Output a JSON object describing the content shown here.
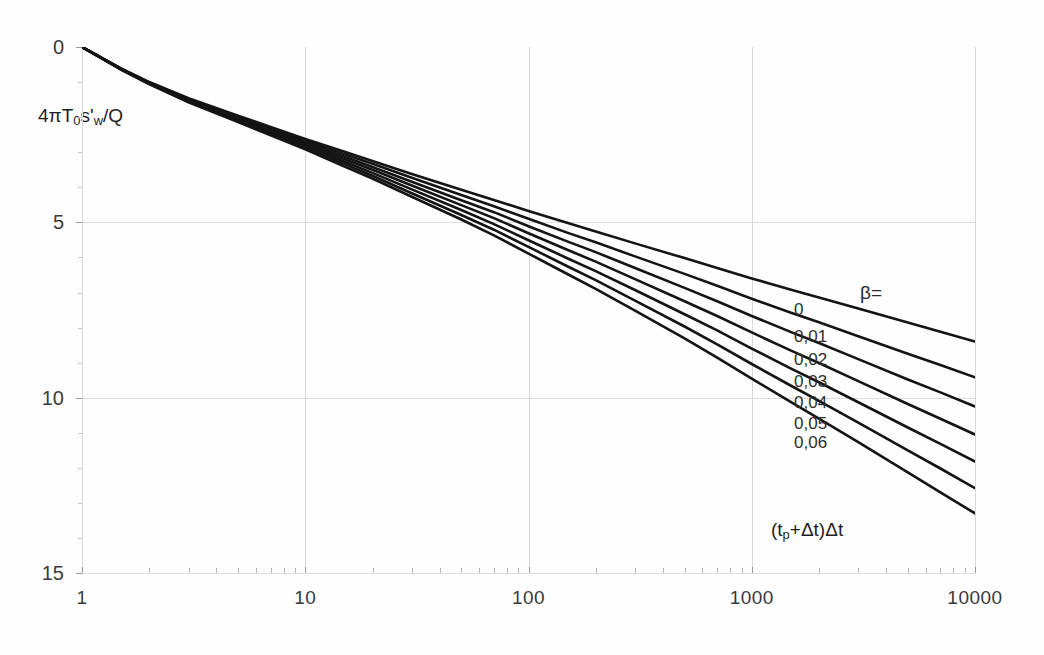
{
  "figure": {
    "kind": "semi-log-plot",
    "background": "#fefefe",
    "ink_color": "#141414",
    "grid_color": "#d8d8d8"
  },
  "chart_data": {
    "type": "line",
    "title": "",
    "xlabel": "(t_p+Δt)Δt",
    "ylabel": "4πT_0s'_w/Q",
    "xscale": "log",
    "yscale": "linear",
    "y_inverted": true,
    "xlim": [
      1,
      10000
    ],
    "ylim": [
      0,
      15
    ],
    "grid": "major-x-and-y",
    "xticks": [
      1,
      10,
      100,
      1000,
      10000
    ],
    "xtick_labels": [
      "1",
      "10",
      "100",
      "1000",
      "10000"
    ],
    "yticks": [
      0,
      5,
      10,
      15
    ],
    "ytick_labels": [
      "0",
      "5",
      "10",
      "15"
    ],
    "legend_position": "inline-right-end-of-curves",
    "legend_title": "β=",
    "annotations": [
      {
        "text": "4πT₀s'ᵥᵥ/Q",
        "kind": "y-axis-title"
      },
      {
        "text": "(tₚ+Δt)Δt",
        "kind": "x-axis-title"
      },
      {
        "text": "β=",
        "kind": "series-group-label"
      }
    ],
    "x": [
      1,
      1.5,
      2,
      3,
      5,
      7,
      10,
      15,
      20,
      30,
      50,
      70,
      100,
      150,
      200,
      300,
      500,
      700,
      1000,
      1500,
      2000,
      3000,
      5000,
      7000,
      10000
    ],
    "series": [
      {
        "name": "0",
        "label": "0",
        "beta": 0.0,
        "values": [
          0.0,
          0.62,
          1.0,
          1.46,
          1.96,
          2.28,
          2.62,
          2.99,
          3.25,
          3.62,
          4.07,
          4.36,
          4.68,
          5.02,
          5.26,
          5.6,
          6.02,
          6.3,
          6.6,
          6.92,
          7.14,
          7.46,
          7.86,
          8.12,
          8.4
        ]
      },
      {
        "name": "0,01",
        "label": "0,01",
        "beta": 0.01,
        "values": [
          0.0,
          0.62,
          1.01,
          1.48,
          1.99,
          2.32,
          2.67,
          3.06,
          3.33,
          3.73,
          4.22,
          4.54,
          4.9,
          5.3,
          5.57,
          5.97,
          6.47,
          6.81,
          7.18,
          7.58,
          7.85,
          8.25,
          8.75,
          9.07,
          9.42
        ]
      },
      {
        "name": "0,02",
        "label": "0,02",
        "beta": 0.02,
        "values": [
          0.0,
          0.63,
          1.02,
          1.5,
          2.02,
          2.36,
          2.72,
          3.13,
          3.42,
          3.84,
          4.37,
          4.71,
          5.11,
          5.55,
          5.85,
          6.3,
          6.87,
          7.25,
          7.67,
          8.13,
          8.44,
          8.9,
          9.48,
          9.85,
          10.25
        ]
      },
      {
        "name": "0,03",
        "label": "0,03",
        "beta": 0.03,
        "values": [
          0.0,
          0.63,
          1.03,
          1.52,
          2.05,
          2.4,
          2.77,
          3.2,
          3.5,
          3.95,
          4.51,
          4.88,
          5.31,
          5.79,
          6.12,
          6.62,
          7.25,
          7.67,
          8.14,
          8.66,
          9.01,
          9.53,
          10.18,
          10.6,
          11.05
        ]
      },
      {
        "name": "0,04",
        "label": "0,04",
        "beta": 0.04,
        "values": [
          0.0,
          0.64,
          1.04,
          1.54,
          2.08,
          2.44,
          2.82,
          3.27,
          3.59,
          4.06,
          4.65,
          5.05,
          5.51,
          6.03,
          6.39,
          6.93,
          7.62,
          8.08,
          8.6,
          9.17,
          9.56,
          10.13,
          10.85,
          11.32,
          11.82
        ]
      },
      {
        "name": "0,05",
        "label": "0,05",
        "beta": 0.05,
        "values": [
          0.0,
          0.64,
          1.05,
          1.56,
          2.11,
          2.48,
          2.87,
          3.34,
          3.67,
          4.17,
          4.79,
          5.21,
          5.7,
          6.26,
          6.65,
          7.23,
          7.97,
          8.48,
          9.04,
          9.66,
          10.09,
          10.71,
          11.5,
          12.02,
          12.58
        ]
      },
      {
        "name": "0,06",
        "label": "0,06",
        "beta": 0.06,
        "values": [
          0.0,
          0.65,
          1.06,
          1.58,
          2.14,
          2.52,
          2.92,
          3.41,
          3.75,
          4.27,
          4.92,
          5.37,
          5.89,
          6.48,
          6.9,
          7.52,
          8.31,
          8.86,
          9.46,
          10.13,
          10.6,
          11.27,
          12.13,
          12.7,
          13.3
        ]
      }
    ],
    "curve_end_labels": [
      {
        "label": "0",
        "y_at_10000": 8.4
      },
      {
        "label": "0,01",
        "y_at_10000": 9.42
      },
      {
        "label": "0,02",
        "y_at_10000": 10.25
      },
      {
        "label": "0,03",
        "y_at_10000": 11.05
      },
      {
        "label": "0,04",
        "y_at_10000": 11.82
      },
      {
        "label": "0,05",
        "y_at_10000": 12.58
      },
      {
        "label": "0,06",
        "y_at_10000": 13.3
      }
    ]
  }
}
